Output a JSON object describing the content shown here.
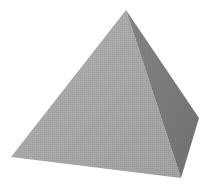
{
  "image": {
    "subject": "square pyramid",
    "background": "#ffffff",
    "faces": {
      "front": {
        "color": "#a9a9a9",
        "points": "126,10 11,157 181,178"
      },
      "side": {
        "color": "#7b7b7b",
        "points": "126,10 181,178 199,118"
      }
    },
    "edge_color": "#8f8f8f"
  }
}
